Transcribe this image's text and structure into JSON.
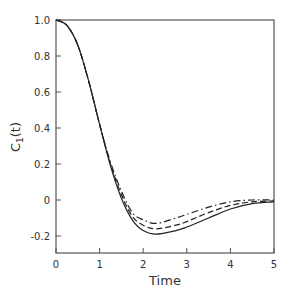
{
  "chart_data": {
    "type": "line",
    "title": "",
    "xlabel": "Time",
    "ylabel": "C1(t)",
    "xlim": [
      0,
      5
    ],
    "ylim": [
      -0.3,
      1.0
    ],
    "xticks": [
      "0",
      "1",
      "2",
      "3",
      "4",
      "5"
    ],
    "yticks": [
      "1.0",
      "0.8",
      "0.6",
      "0.4",
      "0.2",
      "0",
      "-0.2"
    ],
    "grid": false,
    "legend": "none",
    "x": [
      0,
      0.25,
      0.5,
      0.75,
      1.0,
      1.25,
      1.5,
      1.75,
      2.0,
      2.3,
      2.75,
      3.0,
      3.5,
      4.0,
      4.5,
      5.0
    ],
    "series": [
      {
        "name": "solid",
        "style": "solid",
        "values": [
          1.0,
          0.97,
          0.86,
          0.66,
          0.42,
          0.19,
          0.01,
          -0.11,
          -0.17,
          -0.19,
          -0.17,
          -0.15,
          -0.1,
          -0.05,
          -0.02,
          -0.01
        ]
      },
      {
        "name": "dashed",
        "style": "dashed",
        "values": [
          1.0,
          0.97,
          0.86,
          0.66,
          0.42,
          0.2,
          0.03,
          -0.09,
          -0.14,
          -0.16,
          -0.14,
          -0.12,
          -0.07,
          -0.03,
          -0.01,
          -0.005
        ]
      },
      {
        "name": "dash-dot",
        "style": "dash-dot",
        "values": [
          1.0,
          0.97,
          0.86,
          0.66,
          0.42,
          0.21,
          0.05,
          -0.07,
          -0.11,
          -0.13,
          -0.1,
          -0.08,
          -0.04,
          -0.01,
          0.0,
          0.0
        ]
      }
    ]
  },
  "labels": {
    "xlabel": "Time",
    "ylabel_main": "C",
    "ylabel_sub": "1",
    "ylabel_arg": "(t)"
  }
}
